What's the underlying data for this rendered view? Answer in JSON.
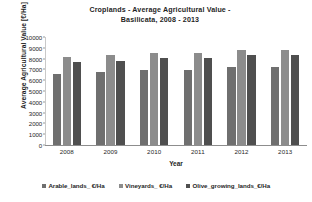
{
  "chart_data": {
    "type": "bar",
    "title": "Croplands - Average Agricultural Value - Basilicata, 2008 - 2013",
    "title_line1": "Croplands - Average Agricultural Value -",
    "title_line2": "Basilicata, 2008 - 2013",
    "xlabel": "Year",
    "ylabel": "Average Agricultural Value  [€/Ha]",
    "categories": [
      "2008",
      "2009",
      "2010",
      "2011",
      "2012",
      "2013"
    ],
    "yticks": [
      "10000",
      "9000",
      "8000",
      "7000",
      "6000",
      "5000",
      "4000",
      "3000",
      "2000",
      "1000",
      "0"
    ],
    "ylim": [
      0,
      10000
    ],
    "ytick_step": 1000,
    "grid": false,
    "legend_position": "bottom",
    "series": [
      {
        "name": "Arable_lands_ €/Ha",
        "color": "#6f6f6f",
        "values": [
          6600,
          6800,
          6950,
          6950,
          7250,
          7250
        ]
      },
      {
        "name": "Vineyards_ €/Ha",
        "color": "#8c8c8c",
        "values": [
          8150,
          8350,
          8500,
          8500,
          8800,
          8800
        ]
      },
      {
        "name": "Olive_growing_lands_€/Ha",
        "color": "#4f4f4f",
        "values": [
          7650,
          7800,
          8050,
          8050,
          8350,
          8350
        ]
      }
    ]
  }
}
